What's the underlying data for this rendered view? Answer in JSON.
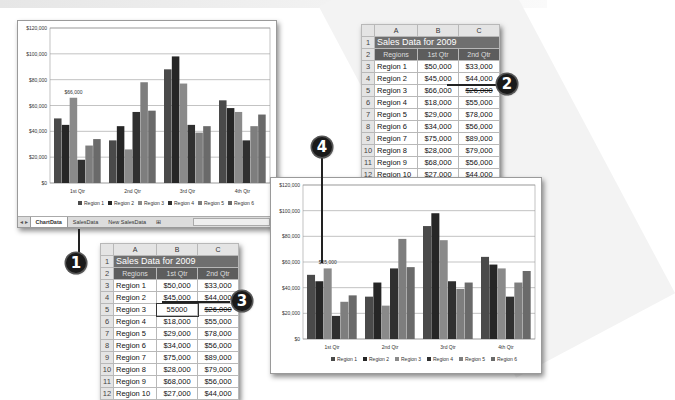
{
  "callouts": [
    "1",
    "2",
    "3",
    "4"
  ],
  "chart_window_1": {
    "sheet_tabs": [
      "ChartData",
      "SalesData",
      "New SalesData"
    ],
    "active_tab": "ChartData",
    "data_label": "$66,000"
  },
  "chart_window_2": {
    "data_label": "$55,000"
  },
  "sheet_top": {
    "columns": [
      "A",
      "B",
      "C"
    ],
    "title": "Sales Data for 2009",
    "headers": [
      "Regions",
      "1st Qtr",
      "2nd Qtr"
    ],
    "rows": [
      {
        "n": "3",
        "region": "Region 1",
        "q1": "$50,000",
        "q2": "$33,000"
      },
      {
        "n": "4",
        "region": "Region 2",
        "q1": "$45,000",
        "q2": "$44,000"
      },
      {
        "n": "5",
        "region": "Region 3",
        "q1": "$66,000",
        "q2": "$26,000"
      },
      {
        "n": "6",
        "region": "Region 4",
        "q1": "$18,000",
        "q2": "$55,000"
      },
      {
        "n": "7",
        "region": "Region 5",
        "q1": "$29,000",
        "q2": "$78,000"
      },
      {
        "n": "8",
        "region": "Region 6",
        "q1": "$34,000",
        "q2": "$56,000"
      },
      {
        "n": "9",
        "region": "Region 7",
        "q1": "$75,000",
        "q2": "$89,000"
      },
      {
        "n": "10",
        "region": "Region 8",
        "q1": "$28,000",
        "q2": "$79,000"
      },
      {
        "n": "11",
        "region": "Region 9",
        "q1": "$68,000",
        "q2": "$56,000"
      },
      {
        "n": "12",
        "region": "Region 10",
        "q1": "$27,000",
        "q2": "$44,000"
      }
    ]
  },
  "sheet_bottom": {
    "columns": [
      "A",
      "B",
      "C"
    ],
    "title": "Sales Data for 2009",
    "headers": [
      "Regions",
      "1st Qtr",
      "2nd Qtr"
    ],
    "rows": [
      {
        "n": "3",
        "region": "Region 1",
        "q1": "$50,000",
        "q2": "$33,000"
      },
      {
        "n": "4",
        "region": "Region 2",
        "q1": "$45,000",
        "q2": "$44,000"
      },
      {
        "n": "5",
        "region": "Region 3",
        "q1": "55000",
        "q2": "$26,000"
      },
      {
        "n": "6",
        "region": "Region 4",
        "q1": "$18,000",
        "q2": "$55,000"
      },
      {
        "n": "7",
        "region": "Region 5",
        "q1": "$29,000",
        "q2": "$78,000"
      },
      {
        "n": "8",
        "region": "Region 6",
        "q1": "$34,000",
        "q2": "$56,000"
      },
      {
        "n": "9",
        "region": "Region 7",
        "q1": "$75,000",
        "q2": "$89,000"
      },
      {
        "n": "10",
        "region": "Region 8",
        "q1": "$28,000",
        "q2": "$79,000"
      },
      {
        "n": "11",
        "region": "Region 9",
        "q1": "$68,000",
        "q2": "$56,000"
      },
      {
        "n": "12",
        "region": "Region 10",
        "q1": "$27,000",
        "q2": "$44,000"
      }
    ]
  },
  "chart_data": [
    {
      "type": "bar",
      "title": "",
      "categories": [
        "1st Qtr",
        "2nd Qtr",
        "3rd Qtr",
        "4th Qtr"
      ],
      "series": [
        {
          "name": "Region 1",
          "values": [
            50000,
            33000,
            88000,
            64000
          ]
        },
        {
          "name": "Region 2",
          "values": [
            45000,
            44000,
            98000,
            58000
          ]
        },
        {
          "name": "Region 3",
          "values": [
            66000,
            26000,
            77000,
            55000
          ]
        },
        {
          "name": "Region 4",
          "values": [
            18000,
            55000,
            45000,
            33000
          ]
        },
        {
          "name": "Region 5",
          "values": [
            29000,
            78000,
            39000,
            44000
          ]
        },
        {
          "name": "Region 6",
          "values": [
            34000,
            56000,
            44000,
            53000
          ]
        }
      ],
      "yticks": [
        "$0",
        "$20,000",
        "$40,000",
        "$60,000",
        "$80,000",
        "$100,000",
        "$120,000"
      ],
      "ylim": [
        0,
        120000
      ],
      "annotations": [
        {
          "text": "$66,000",
          "series": "Region 3",
          "category": "1st Qtr"
        }
      ],
      "legend_position": "bottom",
      "grid": true
    },
    {
      "type": "bar",
      "title": "",
      "categories": [
        "1st Qtr",
        "2nd Qtr",
        "3rd Qtr",
        "4th Qtr"
      ],
      "series": [
        {
          "name": "Region 1",
          "values": [
            50000,
            33000,
            88000,
            64000
          ]
        },
        {
          "name": "Region 2",
          "values": [
            45000,
            44000,
            98000,
            58000
          ]
        },
        {
          "name": "Region 3",
          "values": [
            55000,
            26000,
            77000,
            55000
          ]
        },
        {
          "name": "Region 4",
          "values": [
            18000,
            55000,
            45000,
            33000
          ]
        },
        {
          "name": "Region 5",
          "values": [
            29000,
            78000,
            39000,
            44000
          ]
        },
        {
          "name": "Region 6",
          "values": [
            34000,
            56000,
            44000,
            53000
          ]
        }
      ],
      "yticks": [
        "$0",
        "$20,000",
        "$40,000",
        "$60,000",
        "$80,000",
        "$100,000",
        "$120,000"
      ],
      "ylim": [
        0,
        120000
      ],
      "annotations": [
        {
          "text": "$55,000",
          "series": "Region 3",
          "category": "1st Qtr"
        }
      ],
      "legend_position": "bottom",
      "grid": true
    }
  ],
  "colors": {
    "series": [
      "#4a4a4a",
      "#262626",
      "#8a8a8a",
      "#303030",
      "#7e7e7e",
      "#6a6a6a"
    ],
    "title_fill": "#6f6f6f",
    "header_fill": "#5d5d5d"
  }
}
